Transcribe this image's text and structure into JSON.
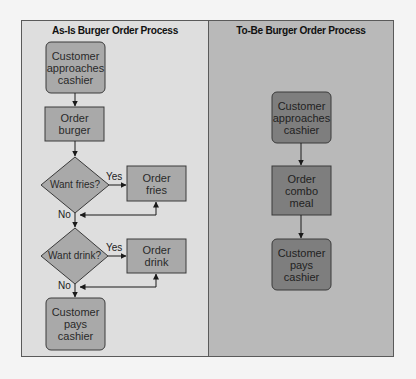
{
  "colors": {
    "page_background": "#f4f4f4",
    "as_is_panel": "#dedede",
    "to_be_panel": "#b9b9b9",
    "as_is_node_fill": "#a9a9a9",
    "to_be_node_fill": "#7e7e7e",
    "stroke": "#3a3a3a"
  },
  "as_is": {
    "title": "As-Is Burger Order Process",
    "nodes": {
      "start": "Customer\napproaches\ncashier",
      "order_burger": "Order\nburger",
      "want_fries": "Want fries?",
      "order_fries": "Order\nfries",
      "want_drink": "Want drink?",
      "order_drink": "Order\ndrink",
      "end": "Customer\npays\ncashier"
    },
    "edge_labels": {
      "fries_yes": "Yes",
      "fries_no": "No",
      "drink_yes": "Yes",
      "drink_no": "No"
    }
  },
  "to_be": {
    "title": "To-Be Burger Order Process",
    "nodes": {
      "start": "Customer\napproaches\ncashier",
      "order_combo": "Order\ncombo\nmeal",
      "end": "Customer\npays\ncashier"
    }
  }
}
